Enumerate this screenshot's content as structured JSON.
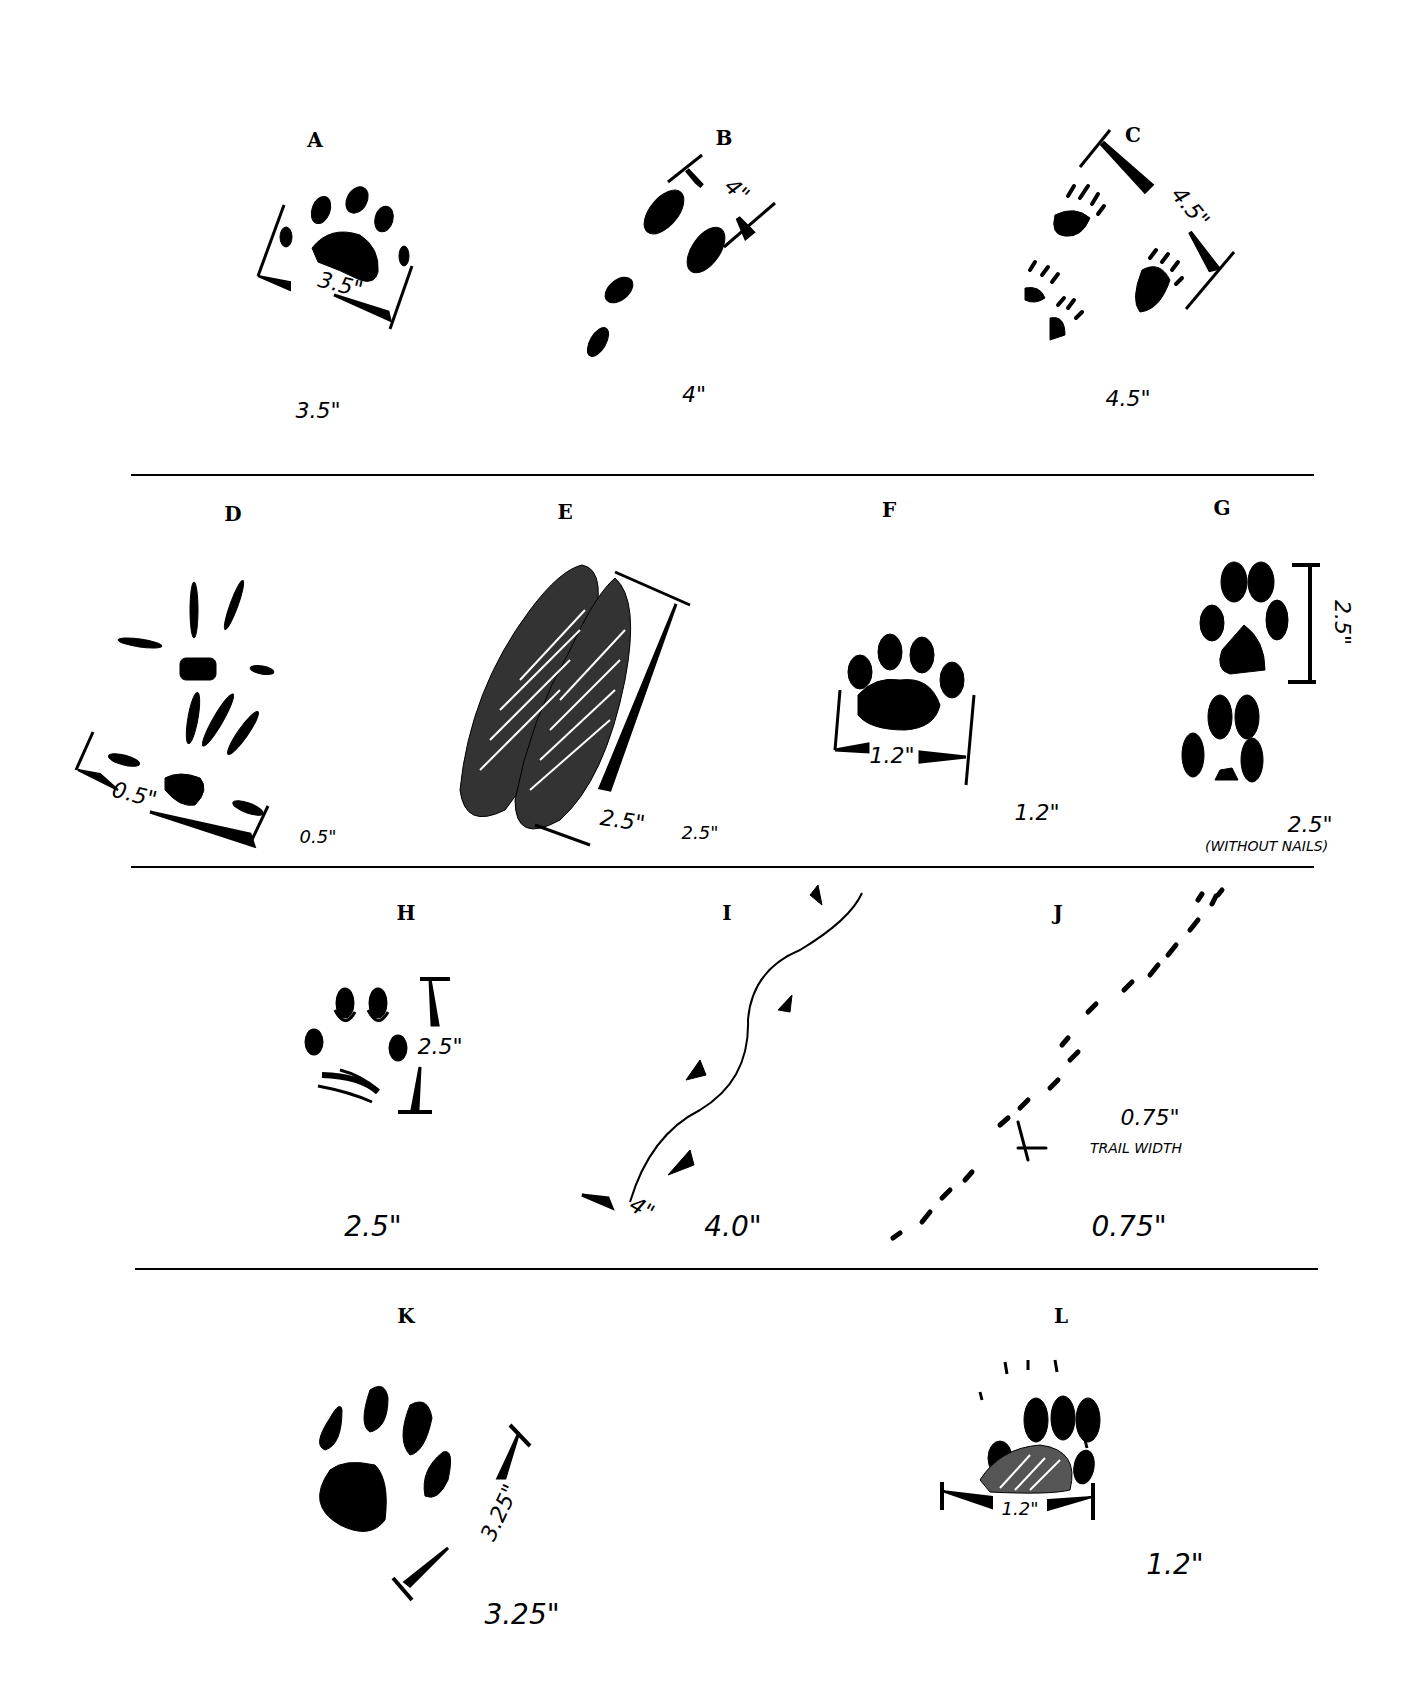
{
  "dividers": [
    {
      "id": "row1-row2",
      "y": 474,
      "x1": 131,
      "x2": 1314
    },
    {
      "id": "row2-row3",
      "y": 866,
      "x1": 131,
      "x2": 1314
    },
    {
      "id": "row3-row4",
      "y": 1268,
      "x1": 135,
      "x2": 1318
    }
  ],
  "prints": [
    {
      "letter": "A",
      "measurement": "3.5\"",
      "dimension_label": "3.5\"",
      "figure": "paw print with five toes, angled"
    },
    {
      "letter": "B",
      "measurement": "4\"",
      "dimension_label": "4\"",
      "figure": "trail of four oval prints"
    },
    {
      "letter": "C",
      "measurement": "4.5\"",
      "dimension_label": "4.5\"",
      "figure": "group of four clawed prints"
    },
    {
      "letter": "D",
      "measurement": "0.5\"",
      "dimension_label": "0.5\"",
      "figure": "bird-like splayed tracks"
    },
    {
      "letter": "E",
      "measurement": "2.5\"",
      "dimension_label": "2.5\"",
      "figure": "cloven hoof print, hatched"
    },
    {
      "letter": "F",
      "measurement": "1.2\"",
      "dimension_label": "1.2\"",
      "figure": "small four-toed paw print"
    },
    {
      "letter": "G",
      "measurement": "2.5\"",
      "note": "(WITHOUT NAILS)",
      "dimension_label": "2.5\"",
      "figure": "two canine prints stacked"
    },
    {
      "letter": "H",
      "measurement": "2.5\"",
      "dimension_label": "2.5\"",
      "figure": "outlined paw print"
    },
    {
      "letter": "I",
      "measurement": "4.0\"",
      "dimension_label": "4\"",
      "figure": "prints along tail-drag line"
    },
    {
      "letter": "J",
      "measurement": "0.75\"",
      "dimension_label": "0.75\"",
      "trail_label": "TRAIL WIDTH",
      "figure": "diagonal trail of small dashes"
    },
    {
      "letter": "K",
      "measurement": "3.25\"",
      "dimension_label": "3.25\"",
      "figure": "large four-toed paw print"
    },
    {
      "letter": "L",
      "measurement": "1.2\"",
      "dimension_label": "1.2\"",
      "figure": "clawed paw with hatched pad"
    }
  ]
}
